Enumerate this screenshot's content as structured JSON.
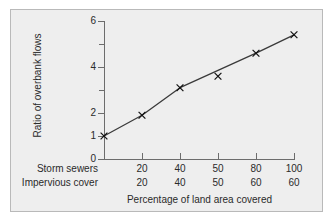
{
  "chart_data": {
    "type": "line",
    "title": "",
    "subtitle": "",
    "xlabel": "Percentage of land area covered",
    "ylabel": "Ratio of overbank flows",
    "grid": false,
    "legend": "none",
    "ylim": [
      0,
      6
    ],
    "y_ticks": [
      0,
      1,
      2,
      4,
      6
    ],
    "y_tick_labels": [
      "0",
      "1",
      "2",
      "4",
      "6"
    ],
    "y_minor_ticks": [
      3,
      5
    ],
    "x_axis_type": "categorical",
    "x_row_labels": [
      "Storm sewers",
      "Impervious cover"
    ],
    "categories": [
      "",
      "20",
      "40",
      "50",
      "80",
      "100"
    ],
    "x_tick_labels_row1": [
      "",
      "20",
      "40",
      "50",
      "80",
      "100"
    ],
    "x_tick_labels_row2": [
      "",
      "20",
      "40",
      "50",
      "60",
      "60"
    ],
    "series": [
      {
        "name": "Ratio of overbank flows",
        "marker": "x",
        "values": [
          1.0,
          1.9,
          3.1,
          3.6,
          4.6,
          5.4
        ]
      }
    ],
    "annotations": []
  },
  "figure": {
    "frame_color": "#b9b9b9",
    "panel_color": "#eeeeee",
    "axis_color": "#6c6c6c",
    "line_color": "#3a3a3a",
    "marker_color": "#111111",
    "text_color": "#2a2a2a"
  }
}
